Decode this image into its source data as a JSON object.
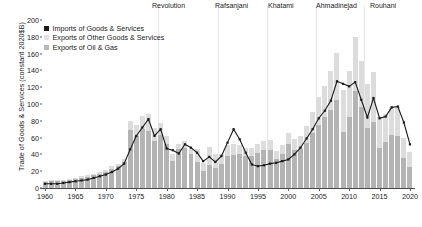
{
  "chart_data": {
    "type": "bar",
    "title": "",
    "xlabel": "",
    "ylabel": "Trade of Goods & Services (constant 2020$B)",
    "xlim": [
      1960,
      2021
    ],
    "ylim": [
      0,
      200
    ],
    "ytick_values": [
      0,
      20,
      40,
      60,
      80,
      100,
      120,
      140,
      160,
      180,
      200
    ],
    "xtick_values": [
      1960,
      1965,
      1970,
      1975,
      1980,
      1985,
      1990,
      1995,
      2000,
      2005,
      2010,
      2015,
      2020
    ],
    "grid": false,
    "legend_position": "upper left",
    "stacked": true,
    "colors": {
      "imports_line": "#1a1a1a",
      "exports_oil_gas": "#b4b4b4",
      "exports_other": "#dcdcdc",
      "divider": "#e7e7e7",
      "axis": "#4a4a4a",
      "background": "#ffffff"
    },
    "legend": [
      {
        "label": "Imports of Goods & Services",
        "swatch": "sw-imports"
      },
      {
        "label": "Exports of Other Goods & Services",
        "swatch": "sw-other"
      },
      {
        "label": "Exports of Oil & Gas",
        "swatch": "sw-oil"
      }
    ],
    "annotations": [
      {
        "label": "Revolution",
        "year": 1979,
        "label_x": 152
      },
      {
        "label": "Rafsanjani",
        "year": 1989,
        "label_x": 215
      },
      {
        "label": "Khatami",
        "year": 1997,
        "label_x": 268
      },
      {
        "label": "Ahmadinejad",
        "year": 2005,
        "label_x": 316
      },
      {
        "label": "Rouhani",
        "year": 2013,
        "label_x": 370
      }
    ],
    "era_divider_years": [
      1979,
      1989,
      1997,
      2005,
      2013
    ],
    "x": [
      1960,
      1961,
      1962,
      1963,
      1964,
      1965,
      1966,
      1967,
      1968,
      1969,
      1970,
      1971,
      1972,
      1973,
      1974,
      1975,
      1976,
      1977,
      1978,
      1979,
      1980,
      1981,
      1982,
      1983,
      1984,
      1985,
      1986,
      1987,
      1988,
      1989,
      1990,
      1991,
      1992,
      1993,
      1994,
      1995,
      1996,
      1997,
      1998,
      1999,
      2000,
      2001,
      2002,
      2003,
      2004,
      2005,
      2006,
      2007,
      2008,
      2009,
      2010,
      2011,
      2012,
      2013,
      2014,
      2015,
      2016,
      2017,
      2018,
      2019,
      2020
    ],
    "series": [
      {
        "name": "Exports of Oil & Gas",
        "kind": "bar-segment",
        "values": [
          7,
          8,
          8,
          9,
          10,
          11,
          12,
          13,
          15,
          17,
          19,
          23,
          26,
          31,
          69,
          62,
          70,
          68,
          56,
          63,
          52,
          32,
          46,
          48,
          40,
          31,
          20,
          27,
          24,
          29,
          38,
          39,
          40,
          38,
          38,
          42,
          45,
          45,
          34,
          40,
          52,
          45,
          47,
          54,
          66,
          75,
          84,
          93,
          105,
          67,
          84,
          115,
          96,
          71,
          78,
          48,
          55,
          63,
          62,
          36,
          25
        ]
      },
      {
        "name": "Exports of Other Goods & Services",
        "kind": "bar-segment",
        "values": [
          1,
          1,
          1,
          1,
          1,
          1,
          2,
          2,
          2,
          2,
          2,
          3,
          3,
          4,
          11,
          13,
          16,
          20,
          15,
          14,
          10,
          8,
          7,
          8,
          8,
          16,
          10,
          22,
          16,
          12,
          13,
          13,
          11,
          10,
          10,
          11,
          11,
          12,
          10,
          11,
          14,
          13,
          15,
          20,
          25,
          33,
          37,
          46,
          56,
          50,
          55,
          65,
          55,
          53,
          60,
          37,
          33,
          34,
          34,
          24,
          18
        ]
      },
      {
        "name": "Imports of Goods & Services",
        "kind": "line",
        "values": [
          5,
          5,
          5,
          6,
          7,
          8,
          9,
          10,
          12,
          14,
          16,
          19,
          23,
          29,
          46,
          62,
          72,
          82,
          62,
          70,
          47,
          45,
          41,
          52,
          48,
          42,
          32,
          37,
          31,
          38,
          54,
          70,
          58,
          42,
          28,
          26,
          27,
          29,
          30,
          32,
          34,
          40,
          48,
          59,
          70,
          83,
          92,
          104,
          127,
          124,
          121,
          126,
          105,
          84,
          107,
          83,
          85,
          96,
          97,
          78,
          52
        ]
      }
    ]
  }
}
